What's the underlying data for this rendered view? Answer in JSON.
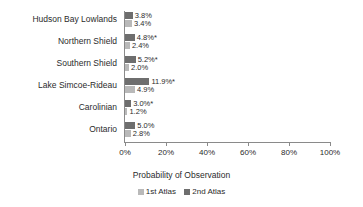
{
  "chart_data": {
    "type": "bar",
    "orientation": "horizontal",
    "title": "",
    "xlabel": "Probability of Observation",
    "ylabel": "",
    "xlim": [
      0,
      100
    ],
    "xtick_labels": [
      "0%",
      "20%",
      "40%",
      "60%",
      "80%",
      "100%"
    ],
    "xticks": [
      0,
      20,
      40,
      60,
      80,
      100
    ],
    "grid": false,
    "legend_position": "bottom",
    "categories": [
      "Hudson Bay Lowlands",
      "Northern Shield",
      "Southern Shield",
      "Lake Simcoe-Rideau",
      "Carolinian",
      "Ontario"
    ],
    "series": [
      {
        "name": "2nd Atlas",
        "color": "#6e6e6e",
        "values": [
          3.8,
          4.8,
          5.2,
          11.9,
          3.0,
          5.0
        ],
        "labels": [
          "3.8%",
          "4.8%*",
          "5.2%*",
          "11.9%*",
          "3.0%*",
          "5.0%"
        ]
      },
      {
        "name": "1st Atlas",
        "color": "#b9b9b9",
        "values": [
          3.4,
          2.4,
          2.0,
          4.9,
          1.2,
          2.8
        ],
        "labels": [
          "3.4%",
          "2.4%",
          "2.0%",
          "4.9%",
          "1.2%",
          "2.8%"
        ]
      }
    ],
    "legend": [
      {
        "label": "1st Atlas",
        "color": "#b9b9b9"
      },
      {
        "label": "2nd Atlas",
        "color": "#6e6e6e"
      }
    ]
  }
}
